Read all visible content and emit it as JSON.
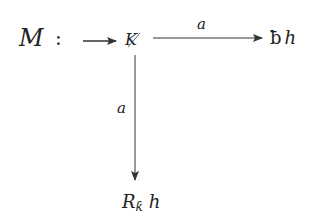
{
  "diagram": {
    "label_M": "M",
    "label_colon": ":",
    "node_origin": "K",
    "node_right_glyph": "ƀ",
    "node_right_var": "h",
    "node_bottom_R": "R",
    "node_bottom_sub": "ƙ",
    "node_bottom_var": "h",
    "edge_right_label": "a",
    "edge_down_label": "a"
  }
}
